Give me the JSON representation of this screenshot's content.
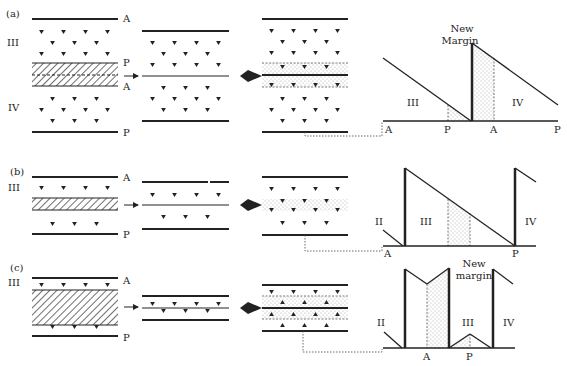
{
  "figure": {
    "panels": [
      {
        "id": "a",
        "label": "(a)",
        "stage1": {
          "top": "A",
          "zone_upper": "III",
          "hatch_top": "P",
          "hatch_bottom": "A",
          "zone_lower": "IV",
          "bottom": "P"
        },
        "graph": {
          "title_line1": "New",
          "title_line2": "Margin",
          "zone_left": "III",
          "zone_right": "IV",
          "axis": [
            "A",
            "P",
            "A",
            "P"
          ]
        }
      },
      {
        "id": "b",
        "label": "(b)",
        "stage1": {
          "top": "A",
          "zone_upper": "III",
          "bottom": "P"
        },
        "graph": {
          "zone_far_left": "II",
          "zone_left": "III",
          "zone_right": "IV",
          "axis": [
            "A",
            "P"
          ]
        }
      },
      {
        "id": "c",
        "label": "(c)",
        "stage1": {
          "top": "A",
          "zone_upper": "III",
          "bottom": "P"
        },
        "graph": {
          "title_line1": "New",
          "title_line2": "margin",
          "zone_far_left": "II",
          "zone_mid": "III",
          "zone_right": "IV",
          "axis": [
            "A",
            "P"
          ]
        }
      }
    ],
    "colors": {
      "ink": "#222222",
      "background": "#ffffff",
      "stipple": "#555555"
    }
  }
}
